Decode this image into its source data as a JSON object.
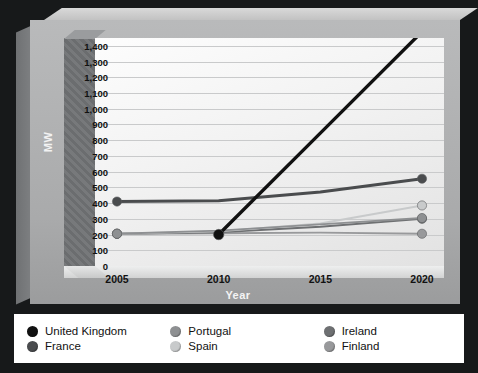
{
  "chart_data": {
    "type": "line",
    "title": "",
    "xlabel": "Year",
    "ylabel": "MW",
    "x": [
      2005,
      2010,
      2015,
      2020
    ],
    "xticklabels": [
      "2005",
      "2010",
      "2015",
      "2020"
    ],
    "yticklabels": [
      "1,400",
      "1,300",
      "1,200",
      "1,100",
      "1,000",
      "900",
      "800",
      "700",
      "600",
      "500",
      "400",
      "300",
      "200",
      "100",
      "0"
    ],
    "yticks": [
      1400,
      1300,
      1200,
      1100,
      1000,
      900,
      800,
      700,
      600,
      500,
      400,
      300,
      200,
      100,
      0
    ],
    "ylim": [
      0,
      1450
    ],
    "grid": true,
    "legend_position": "bottom",
    "style": "3d-grayscale",
    "series": [
      {
        "name": "United Kingdom",
        "color": "#111111",
        "values": [
          null,
          200,
          845,
          1490
        ]
      },
      {
        "name": "France",
        "color": "#4a4c4e",
        "values": [
          410,
          415,
          470,
          555
        ]
      },
      {
        "name": "Portugal",
        "color": "#8e9092",
        "values": [
          205,
          225,
          265,
          305
        ]
      },
      {
        "name": "Spain",
        "color": "#c8cacb",
        "values": [
          205,
          220,
          270,
          385
        ]
      },
      {
        "name": "Ireland",
        "color": "#6e7072",
        "values": [
          205,
          215,
          250,
          300
        ]
      },
      {
        "name": "Finland",
        "color": "#98999b",
        "values": [
          205,
          208,
          212,
          205
        ]
      }
    ]
  },
  "legend": {
    "columns": [
      [
        {
          "label": "United Kingdom",
          "color": "#111111"
        },
        {
          "label": "France",
          "color": "#4a4c4e"
        }
      ],
      [
        {
          "label": "Portugal",
          "color": "#8e9092"
        },
        {
          "label": "Spain",
          "color": "#c8cacb"
        }
      ],
      [
        {
          "label": "Ireland",
          "color": "#6e7072"
        },
        {
          "label": "Finland",
          "color": "#98999b"
        }
      ]
    ]
  }
}
